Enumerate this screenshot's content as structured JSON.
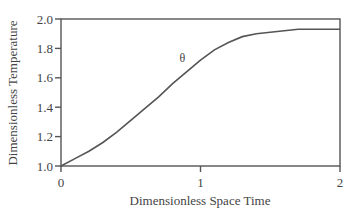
{
  "chart_data": {
    "type": "line",
    "title": "",
    "xlabel": "Dimensionless Space Time",
    "ylabel": "Dimensionless Temperature",
    "xlim": [
      0,
      2
    ],
    "ylim": [
      1.0,
      2.0
    ],
    "xticks": [
      "0",
      "1",
      "2"
    ],
    "yticks": [
      "1.0",
      "1.2",
      "1.4",
      "1.6",
      "1.8",
      "2.0"
    ],
    "grid": false,
    "legend": null,
    "annotations": [
      {
        "text": "θ",
        "x": 0.85,
        "y": 1.71
      }
    ],
    "series": [
      {
        "name": "θ",
        "x": [
          0,
          0.1,
          0.2,
          0.3,
          0.4,
          0.5,
          0.6,
          0.7,
          0.8,
          0.9,
          1.0,
          1.1,
          1.2,
          1.3,
          1.4,
          1.5,
          1.6,
          1.7,
          1.8,
          1.9,
          2.0
        ],
        "values": [
          1.0,
          1.05,
          1.1,
          1.16,
          1.23,
          1.31,
          1.39,
          1.47,
          1.56,
          1.64,
          1.72,
          1.79,
          1.84,
          1.88,
          1.9,
          1.91,
          1.92,
          1.93,
          1.93,
          1.93,
          1.93
        ]
      }
    ]
  }
}
